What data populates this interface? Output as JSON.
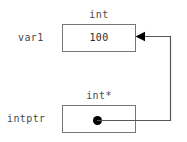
{
  "diagram": {
    "background_color": "#ffffff",
    "border_color": "#77777a",
    "text_color": "#4a4a4d",
    "value_color": "#2b2b2b",
    "pointer_color": "#000000",
    "variables": [
      {
        "name": "var1",
        "type": "int",
        "value": "100",
        "box": {
          "x": 62,
          "y": 24,
          "width": 74,
          "height": 28
        },
        "kind": "value"
      },
      {
        "name": "intptr",
        "type": "int*",
        "value": "",
        "box": {
          "x": 62,
          "y": 105,
          "width": 74,
          "height": 28
        },
        "kind": "pointer"
      }
    ],
    "pointer_link": {
      "from": "intptr",
      "to": "var1",
      "dot_center": {
        "x": 97,
        "y": 120
      },
      "path": "M136,121 H170 V36 H139",
      "arrowhead_at": {
        "x": 136,
        "y": 36
      },
      "arrow_direction": "left"
    }
  }
}
